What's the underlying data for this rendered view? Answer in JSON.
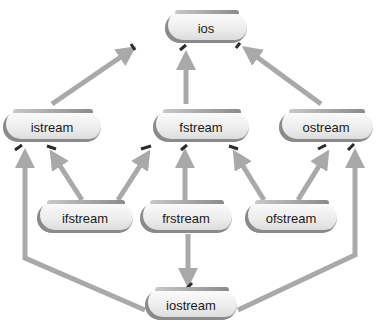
{
  "diagram": {
    "title": "",
    "header_text": "",
    "nodes": [
      {
        "id": "ios",
        "label": "ios"
      },
      {
        "id": "istream",
        "label": "istream"
      },
      {
        "id": "fstream",
        "label": "fstream"
      },
      {
        "id": "ostream",
        "label": "ostream"
      },
      {
        "id": "ifstream",
        "label": "ifstream"
      },
      {
        "id": "frstream",
        "label": "frstream"
      },
      {
        "id": "ofstream",
        "label": "ofstream"
      },
      {
        "id": "iostream",
        "label": "iostream"
      }
    ],
    "edges": [
      {
        "from": "istream",
        "to": "ios"
      },
      {
        "from": "fstream",
        "to": "ios"
      },
      {
        "from": "ostream",
        "to": "ios"
      },
      {
        "from": "ifstream",
        "to": "istream"
      },
      {
        "from": "ifstream",
        "to": "fstream"
      },
      {
        "from": "frstream",
        "to": "fstream"
      },
      {
        "from": "frstream",
        "to": "iostream"
      },
      {
        "from": "ofstream",
        "to": "fstream"
      },
      {
        "from": "ofstream",
        "to": "ostream"
      },
      {
        "from": "iostream",
        "to": "istream"
      },
      {
        "from": "iostream",
        "to": "ostream"
      }
    ],
    "colors": {
      "arrow": "#a9a9a9",
      "arrow_tip_mark": "#2b2b2b",
      "node_fill": "#ececec",
      "node_shadow": "#6e6e6e",
      "text": "#1a1a1a"
    }
  }
}
